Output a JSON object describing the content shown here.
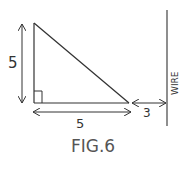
{
  "diagram": {
    "figure_label": "FIG.6",
    "triangle": {
      "vertical_side_label": "5",
      "horizontal_side_label": "5",
      "right_angle": true
    },
    "gap_label": "3",
    "wire_label": "WIRE",
    "stroke_color": "#333333",
    "background": "#ffffff"
  }
}
